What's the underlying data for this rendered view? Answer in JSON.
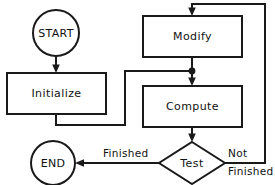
{
  "diagram": {
    "type": "flowchart",
    "background_color": "#ffffff",
    "line_color": "#1a1a1a",
    "text_color": "#111111",
    "nodes": [
      {
        "id": "start",
        "label": "START",
        "shape": "circle"
      },
      {
        "id": "initialize",
        "label": "Initialize",
        "shape": "rectangle"
      },
      {
        "id": "modify",
        "label": "Modify",
        "shape": "rectangle"
      },
      {
        "id": "compute",
        "label": "Compute",
        "shape": "rectangle"
      },
      {
        "id": "test",
        "label": "Test",
        "shape": "diamond"
      },
      {
        "id": "end",
        "label": "END",
        "shape": "circle"
      }
    ],
    "edges": [
      {
        "from": "start",
        "to": "initialize",
        "label": ""
      },
      {
        "from": "initialize",
        "to": "compute",
        "label": ""
      },
      {
        "from": "modify",
        "to": "compute",
        "label": ""
      },
      {
        "from": "compute",
        "to": "test",
        "label": ""
      },
      {
        "from": "test",
        "to": "end",
        "label": "Finished"
      },
      {
        "from": "test",
        "to": "modify",
        "label_line1": "Not",
        "label_line2": "Finished"
      }
    ],
    "edge_labels": {
      "finished": "Finished",
      "not_line1": "Not",
      "not_line2": "Finished"
    }
  }
}
